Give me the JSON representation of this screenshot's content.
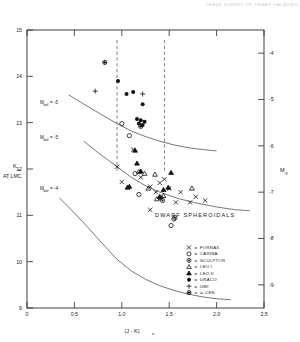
{
  "header": {
    "note": "2MASS SURVEY OF DWARF GALAXIES"
  },
  "axes": {
    "left": {
      "label": "K",
      "label_sub": "o",
      "caption": "AT LMC",
      "ticks": [
        "9",
        "10",
        "11",
        "12",
        "13",
        "14",
        "15"
      ],
      "values": [
        9,
        10,
        11,
        12,
        13,
        14,
        15
      ],
      "min": 9,
      "max": 15
    },
    "right": {
      "label": "M",
      "label_sub": "K",
      "ticks": [
        "-9",
        "-8",
        "-7",
        "-6",
        "-5",
        "-4"
      ],
      "values": [
        -9,
        -8,
        -7,
        -6,
        -5,
        -4
      ],
      "min": -9.5,
      "max": -3.5
    },
    "bottom": {
      "label": "(J - K)",
      "label_sub": "o",
      "ticks": [
        "0",
        "0.5",
        "1.0",
        "1.5",
        "2.0",
        "2.5"
      ],
      "values": [
        0,
        0.5,
        1.0,
        1.5,
        2.0,
        2.5
      ],
      "min": 0,
      "max": 2.5
    }
  },
  "annotations": {
    "plot_title": "DWARF  SPHEROIDALS",
    "curve_labels": [
      {
        "text": "M",
        "sub": "bol",
        "eq": "= -5"
      },
      {
        "text": "M",
        "sub": "bol",
        "eq": "= -5"
      },
      {
        "text": "M",
        "sub": "bol",
        "eq": "= -4"
      }
    ]
  },
  "legend": {
    "entries": [
      {
        "symbol": "cross-x",
        "glyph": "x",
        "sep": "=",
        "label": "FORNAX"
      },
      {
        "symbol": "open-circle",
        "glyph": "O",
        "sep": "=",
        "label": "CARINA"
      },
      {
        "symbol": "crossed-circle",
        "glyph": "@",
        "sep": "=",
        "label": "SCULPTOR"
      },
      {
        "symbol": "open-triangle",
        "glyph": "^",
        "sep": "=",
        "label": "LEO I"
      },
      {
        "symbol": "filled-triangle",
        "glyph": "^",
        "sep": "=",
        "label": "LEO II"
      },
      {
        "symbol": "filled-circle",
        "glyph": "*",
        "sep": "=",
        "label": "DRACO"
      },
      {
        "symbol": "plus",
        "glyph": "+",
        "sep": "=",
        "label": "UMI"
      },
      {
        "symbol": "sun-circle",
        "glyph": "@",
        "sep": "=",
        "label": "ω CEN"
      }
    ]
  },
  "chart_data": {
    "type": "scatter",
    "title": "DWARF  SPHEROIDALS",
    "xlabel": "(J - K)o",
    "ylabel": "Ko AT LMC",
    "y2label": "MK",
    "xlim": [
      0,
      2.5
    ],
    "ylim": [
      15,
      9
    ],
    "y2lim": [
      -3.5,
      -9.5
    ],
    "grid": false,
    "legend_position": "bottom-right",
    "series": [
      {
        "name": "FORNAX",
        "symbol": "cross-x",
        "points": [
          [
            1.3,
            11.12
          ],
          [
            1.57,
            11.28
          ],
          [
            1.72,
            11.28
          ],
          [
            1.0,
            11.72
          ],
          [
            1.36,
            11.5
          ],
          [
            1.5,
            11.58
          ],
          [
            1.62,
            11.5
          ],
          [
            1.3,
            11.62
          ],
          [
            1.4,
            11.7
          ],
          [
            1.78,
            11.4
          ],
          [
            1.88,
            11.32
          ],
          [
            1.2,
            11.82
          ],
          [
            1.45,
            11.78
          ],
          [
            1.12,
            12.42
          ],
          [
            0.95,
            12.05
          ]
        ]
      },
      {
        "name": "CARINA",
        "symbol": "open-circle",
        "points": [
          [
            1.52,
            10.78
          ],
          [
            1.55,
            10.92
          ],
          [
            1.18,
            11.45
          ],
          [
            1.14,
            11.9
          ],
          [
            1.08,
            12.72
          ],
          [
            1.0,
            12.98
          ]
        ]
      },
      {
        "name": "SCULPTOR",
        "symbol": "crossed-circle",
        "points": [
          [
            1.56,
            10.95
          ],
          [
            1.41,
            11.38
          ],
          [
            1.43,
            11.32
          ]
        ]
      },
      {
        "name": "LEO I",
        "symbol": "open-triangle",
        "points": [
          [
            1.37,
            11.35
          ],
          [
            1.44,
            11.42
          ],
          [
            1.74,
            11.58
          ],
          [
            1.28,
            11.58
          ],
          [
            1.24,
            11.9
          ],
          [
            1.18,
            11.94
          ],
          [
            1.35,
            11.88
          ]
        ]
      },
      {
        "name": "LEO II",
        "symbol": "filled-triangle",
        "points": [
          [
            1.08,
            11.62
          ],
          [
            1.4,
            11.4
          ],
          [
            1.44,
            11.55
          ],
          [
            1.49,
            11.6
          ],
          [
            1.52,
            11.92
          ],
          [
            1.16,
            12.12
          ],
          [
            1.14,
            12.4
          ],
          [
            1.2,
            11.95
          ],
          [
            1.06,
            11.6
          ]
        ]
      },
      {
        "name": "DRACO",
        "symbol": "filled-circle",
        "points": [
          [
            1.18,
            12.98
          ],
          [
            1.22,
            12.95
          ],
          [
            1.2,
            13.05
          ],
          [
            1.24,
            13.02
          ],
          [
            1.16,
            13.08
          ],
          [
            1.22,
            13.4
          ],
          [
            1.05,
            13.62
          ],
          [
            1.12,
            13.66
          ],
          [
            0.96,
            13.9
          ]
        ]
      },
      {
        "name": "UMI",
        "symbol": "plus",
        "points": [
          [
            0.72,
            13.68
          ],
          [
            1.22,
            13.62
          ]
        ]
      },
      {
        "name": "ω CEN",
        "symbol": "sun-circle",
        "points": [
          [
            1.2,
            12.92
          ],
          [
            0.82,
            14.3
          ]
        ]
      }
    ],
    "curves": [
      {
        "name": "Mbol = -5 (upper)",
        "points": [
          [
            0.34,
            11.38
          ],
          [
            0.5,
            11.05
          ],
          [
            0.66,
            10.7
          ],
          [
            0.8,
            10.38
          ],
          [
            0.95,
            10.05
          ],
          [
            1.1,
            9.8
          ],
          [
            1.25,
            9.62
          ],
          [
            1.4,
            9.48
          ],
          [
            1.55,
            9.38
          ],
          [
            1.7,
            9.3
          ],
          [
            1.85,
            9.24
          ],
          [
            2.0,
            9.2
          ],
          [
            2.15,
            9.18
          ]
        ]
      },
      {
        "name": "Mbol = -5 (middle)",
        "points": [
          [
            0.6,
            12.6
          ],
          [
            0.75,
            12.35
          ],
          [
            0.95,
            12.05
          ],
          [
            1.1,
            11.82
          ],
          [
            1.25,
            11.64
          ],
          [
            1.4,
            11.5
          ],
          [
            1.6,
            11.36
          ],
          [
            1.8,
            11.26
          ],
          [
            2.0,
            11.18
          ],
          [
            2.2,
            11.12
          ],
          [
            2.35,
            11.1
          ]
        ]
      },
      {
        "name": "Mbol = -4 (lower)",
        "points": [
          [
            0.44,
            13.6
          ],
          [
            0.6,
            13.4
          ],
          [
            0.78,
            13.18
          ],
          [
            0.95,
            12.98
          ],
          [
            1.1,
            12.82
          ],
          [
            1.25,
            12.7
          ],
          [
            1.4,
            12.6
          ],
          [
            1.55,
            12.52
          ],
          [
            1.7,
            12.46
          ],
          [
            1.85,
            12.42
          ],
          [
            2.0,
            12.39
          ]
        ]
      }
    ],
    "vertical_dashed_lines": [
      0.95,
      1.45
    ]
  }
}
